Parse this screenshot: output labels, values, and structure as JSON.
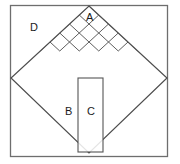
{
  "figure": {
    "type": "geometric-diagram",
    "canvas": {
      "width": 180,
      "height": 164,
      "background": "#ffffff"
    },
    "colors": {
      "outline": "#6e6e6e",
      "grid": "#4d4d4d",
      "diamond": "#4d4d4d",
      "rectangle": "#555555",
      "label": "#1b1b1b",
      "fill": "#ffffff"
    },
    "outer_square": {
      "name": "outer-square",
      "x": 10.5,
      "y": 5.5,
      "width": 157,
      "height": 151,
      "stroke_width": 1.3
    },
    "diamond": {
      "name": "inscribed-diamond",
      "top": {
        "x": 89,
        "y": 6
      },
      "right": {
        "x": 167,
        "y": 78
      },
      "bottom": {
        "x": 89,
        "y": 153
      },
      "left": {
        "x": 11,
        "y": 78
      },
      "stroke_width": 1.2
    },
    "lattice": {
      "name": "tilted-grid",
      "cells_across": 8,
      "cells_down": 8,
      "filled_rows_from_top": 5,
      "stroke_width": 0.9,
      "description": "diagonal square lattice filling the upper portion of the diamond"
    },
    "inner_rectangle": {
      "name": "inner-rectangle",
      "x": 78,
      "y": 78,
      "width": 25,
      "height": 74,
      "stroke_width": 1.1
    },
    "labels": [
      {
        "id": "label-a",
        "text": "A",
        "x": 86,
        "y": 12
      },
      {
        "id": "label-d",
        "text": "D",
        "x": 30,
        "y": 22
      },
      {
        "id": "label-b",
        "text": "B",
        "x": 65,
        "y": 106
      },
      {
        "id": "label-c",
        "text": "C",
        "x": 87,
        "y": 106
      }
    ]
  }
}
